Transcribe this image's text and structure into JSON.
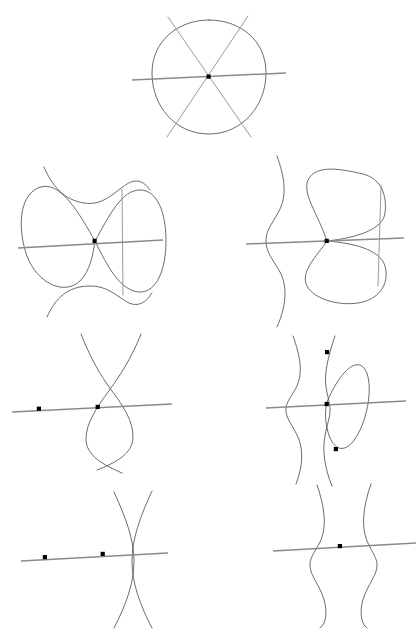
{
  "document": {
    "title": "Curve Singularity Configurations",
    "background_color": "#ffffff",
    "width": 419,
    "height": 630,
    "text_labels": []
  },
  "style": {
    "curve_color": "#5a5a5a",
    "line_color": "#8a8a8a",
    "dot_color": "#000000",
    "curve_width": 0.9,
    "line_width": 1.5
  },
  "figures": [
    {
      "id": "figure-1",
      "name": "circle-with-three-concurrent-lines",
      "row": 1,
      "column": "center",
      "center": [
        209,
        77
      ],
      "description": "Oval with three straight chords meeting at a single interior triple point",
      "marked_point_count": 1,
      "marked_points": [
        [
          209,
          77
        ]
      ],
      "component_count": 4
    },
    {
      "id": "figure-2",
      "name": "figure-eight-with-wave-and-line",
      "row": 2,
      "column": "left",
      "center": [
        95,
        241
      ],
      "description": "Figure-eight loop, an S-shaped wave, and a near-horizontal line all through one node",
      "marked_point_count": 1,
      "marked_points": [
        [
          95,
          241
        ]
      ],
      "component_count": 3
    },
    {
      "id": "figure-3",
      "name": "self-crossing-loop-with-diagonal-and-wave",
      "row": 2,
      "column": "right",
      "center": [
        327,
        241
      ],
      "description": "Self-crossing closed loop with a diagonal line, a detached S-wave at left, and a horizontal line",
      "marked_point_count": 1,
      "marked_points": [
        [
          327,
          241
        ]
      ],
      "component_count": 4
    },
    {
      "id": "figure-4",
      "name": "two-waves-crossing-with-line-and-free-point",
      "row": 3,
      "column": "left",
      "center": [
        98,
        407
      ],
      "description": "Two S-waves crossing on a horizontal line, with an extra isolated marked point at left",
      "marked_point_count": 2,
      "marked_points": [
        [
          39,
          409
        ],
        [
          98,
          407
        ]
      ],
      "component_count": 3
    },
    {
      "id": "figure-5",
      "name": "wave-with-lens-loop-and-two-free-points",
      "row": 3,
      "column": "right",
      "center": [
        327,
        404
      ],
      "description": "Detached S-wave, a wave carrying a lens-shaped loop, a horizontal line, and two marked points on the wave",
      "marked_point_count": 3,
      "marked_points": [
        [
          327,
          352
        ],
        [
          327,
          404
        ],
        [
          336,
          449
        ]
      ],
      "component_count": 4
    },
    {
      "id": "figure-6",
      "name": "lens-pair-with-line-and-two-points",
      "row": 4,
      "column": "left",
      "center": [
        103,
        554
      ],
      "description": "Two arcs crossing twice to form a lens, cut by a horizontal line carrying two marked points",
      "marked_point_count": 2,
      "marked_points": [
        [
          45,
          557
        ],
        [
          103,
          554
        ]
      ],
      "component_count": 3
    },
    {
      "id": "figure-7",
      "name": "two-disjoint-waves-with-line-and-point",
      "row": 4,
      "column": "right",
      "center": [
        340,
        546
      ],
      "description": "Two disjoint S-waves crossed by a horizontal line with a single marked point between them",
      "marked_point_count": 1,
      "marked_points": [
        [
          340,
          546
        ]
      ],
      "component_count": 3
    }
  ]
}
